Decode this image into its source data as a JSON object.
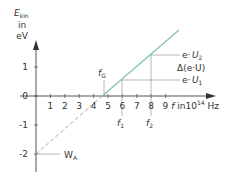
{
  "chart_data": {
    "type": "line",
    "title": "",
    "xlabel": "f in 10^14 Hz",
    "ylabel": "E_kin in eV",
    "ylabel_lines": [
      "E",
      "in",
      "eV"
    ],
    "ylabel_sub": "kin",
    "xlabel_parts": {
      "main": "f in10",
      "sup": "14",
      "unit": " Hz"
    },
    "xlim": [
      0,
      9.5
    ],
    "ylim": [
      -2.5,
      2
    ],
    "x_ticks": [
      1,
      2,
      3,
      4,
      5,
      6,
      7,
      8,
      9
    ],
    "y_ticks": [
      1,
      0,
      -1,
      -2
    ],
    "grid": false,
    "series": [
      {
        "name": "E_kin(f)",
        "style": "solid",
        "color": "#7fc4b4",
        "x": [
          4.6,
          9.6
        ],
        "y": [
          0,
          2.25
        ]
      },
      {
        "name": "extrapolation",
        "style": "dashed",
        "color": "#aaaaaa",
        "x": [
          0,
          4.6
        ],
        "y": [
          -2,
          0
        ]
      }
    ],
    "annotations": [
      {
        "label": "f",
        "sub": "G",
        "x": 4.6,
        "y": 0,
        "meaning": "threshold frequency"
      },
      {
        "label": "f",
        "sub": "1",
        "x": 5.9,
        "y": 0.55
      },
      {
        "label": "f",
        "sub": "2",
        "x": 7.9,
        "y": 1.4
      },
      {
        "label": "e·U",
        "sub": "2",
        "y": 1.4
      },
      {
        "label": "e·U",
        "sub": "1",
        "y": 0.55
      },
      {
        "label": "Δ(e·U)"
      },
      {
        "label": "W",
        "sub": "A",
        "y": -2,
        "meaning": "work function"
      }
    ]
  }
}
